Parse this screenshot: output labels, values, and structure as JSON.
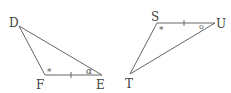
{
  "diagram": {
    "type": "congruent-triangles",
    "triangles": [
      {
        "name": "DFE",
        "vertices": [
          {
            "label": "D",
            "x": 19,
            "y": 26,
            "lx": 9,
            "ly": 27
          },
          {
            "label": "F",
            "x": 45,
            "y": 75,
            "lx": 36,
            "ly": 89
          },
          {
            "label": "E",
            "x": 102,
            "y": 75,
            "lx": 96,
            "ly": 89
          }
        ],
        "markings": {
          "angle_star": {
            "vertex": "F",
            "symbol": "*",
            "x": 47,
            "y": 75
          },
          "angle_alpha": {
            "vertex": "E",
            "symbol": "α",
            "x": 86,
            "y": 74
          },
          "side_tick": {
            "side": "FE",
            "x": 71,
            "y": 75
          }
        }
      },
      {
        "name": "STU",
        "vertices": [
          {
            "label": "S",
            "x": 157,
            "y": 23,
            "lx": 151,
            "ly": 21
          },
          {
            "label": "U",
            "x": 215,
            "y": 23,
            "lx": 216,
            "ly": 28
          },
          {
            "label": "T",
            "x": 130,
            "y": 74,
            "lx": 125,
            "ly": 88
          }
        ],
        "markings": {
          "angle_star": {
            "vertex": "S",
            "symbol": "*",
            "x": 159,
            "y": 33
          },
          "angle_circle": {
            "vertex": "U",
            "symbol": "o",
            "x": 199,
            "y": 29
          },
          "side_tick": {
            "side": "SU",
            "x": 184,
            "y": 23
          }
        }
      }
    ]
  }
}
